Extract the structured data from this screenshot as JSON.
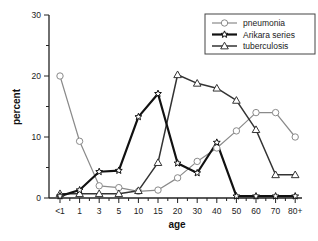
{
  "chart_data": {
    "type": "line",
    "title": "",
    "xlabel": "age",
    "ylabel": "percent",
    "ylim": [
      0,
      30
    ],
    "y_ticks": [
      0,
      10,
      20,
      30
    ],
    "y_minor_ticks": [
      5,
      15,
      25
    ],
    "grid": false,
    "legend_position": "upper right",
    "categories": [
      "<1",
      "1",
      "3",
      "5",
      "10",
      "15",
      "20",
      "30",
      "40",
      "50",
      "60",
      "70",
      "80+"
    ],
    "series": [
      {
        "name": "pneumonia",
        "marker": "circle",
        "color": "#8a8a8a",
        "line_width": 1.2,
        "values": [
          20,
          9.3,
          2.0,
          1.7,
          1.1,
          1.3,
          3.3,
          6.0,
          8.2,
          11.0,
          14.0,
          14.0,
          10.0
        ]
      },
      {
        "name": "Arikara series",
        "marker": "star",
        "color": "#111111",
        "line_width": 2.2,
        "values": [
          0.3,
          1.3,
          4.3,
          4.5,
          13.3,
          17.1,
          5.7,
          4.1,
          9.1,
          0.3,
          0.3,
          0.3,
          0.3
        ]
      },
      {
        "name": "tuberculosis",
        "marker": "triangle",
        "color": "#333333",
        "line_width": 1.5,
        "values": [
          0.7,
          0.7,
          0.7,
          0.7,
          1.2,
          5.8,
          20.2,
          18.8,
          18.0,
          16.0,
          11.2,
          3.8,
          3.8
        ]
      }
    ]
  }
}
